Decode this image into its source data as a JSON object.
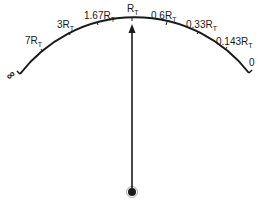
{
  "diagram": {
    "type": "ohmmeter-scale",
    "colors": {
      "ink": "#1a1a1a",
      "background": "#ffffff"
    },
    "scale_labels": [
      {
        "id": "inf",
        "main": "∞",
        "sub": ""
      },
      {
        "id": "7rt",
        "main": "7R",
        "sub": "T"
      },
      {
        "id": "3rt",
        "main": "3R",
        "sub": "T"
      },
      {
        "id": "167rt",
        "main": "1.67R",
        "sub": "T"
      },
      {
        "id": "rt",
        "main": "R",
        "sub": "T"
      },
      {
        "id": "06rt",
        "main": "0.6R",
        "sub": "T"
      },
      {
        "id": "033rt",
        "main": "0.33R",
        "sub": "T"
      },
      {
        "id": "0143rt",
        "main": "0.143R",
        "sub": "T"
      },
      {
        "id": "zero",
        "main": "0",
        "sub": ""
      }
    ],
    "pointer": {
      "position_label": "R_T",
      "description": "needle pointing at mid-scale"
    }
  }
}
